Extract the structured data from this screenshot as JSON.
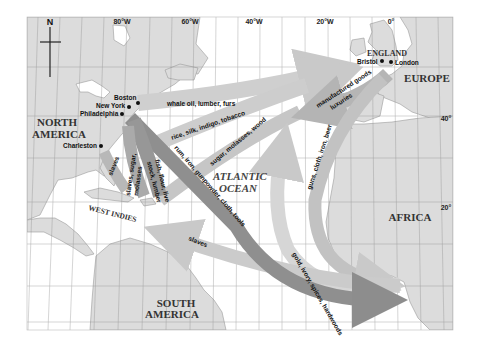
{
  "map": {
    "compass": {
      "label": "N"
    },
    "longitudes": [
      "80°W",
      "60°W",
      "40°W",
      "20°W",
      "0°"
    ],
    "latitudes": [
      "40°",
      "20°"
    ],
    "regions": {
      "north_america": [
        "NORTH",
        "AMERICA"
      ],
      "south_america": [
        "SOUTH",
        "AMERICA"
      ],
      "europe": "EUROPE",
      "england": "ENGLAND",
      "africa": "AFRICA",
      "west_indies": "WEST INDIES"
    },
    "ocean": [
      "ATLANTIC",
      "OCEAN"
    ],
    "cities": {
      "boston": "Boston",
      "new_york": "New York",
      "philadelphia": "Philadelphia",
      "charleston": "Charleston",
      "bristol": "Bristol",
      "london": "London"
    },
    "routes": {
      "whale_oil": "whale oil, lumber, furs",
      "rice": "rice, silk, indigo, tobacco",
      "sugar": "sugar, molasses, wood",
      "manufactured_1": "manufactured goods",
      "manufactured_2": "luxuries",
      "guns": "guns, cloth, iron, beer",
      "gold": "gold, ivory, spices, hardwoods",
      "rum": "rum, iron, gunpowder, cloth, tools",
      "slaves_sa": "slaves",
      "slaves_wi": "slaves",
      "slaves_sugar_1": "slaves, sugar,",
      "slaves_sugar_2": "molasses",
      "fish_1": "fish, flour, live",
      "fish_2": "stock, lumber"
    }
  }
}
